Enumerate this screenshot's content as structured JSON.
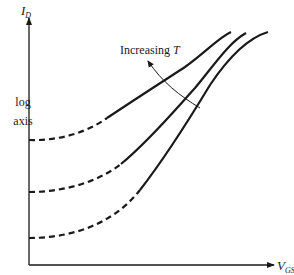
{
  "diagram": {
    "y_axis": {
      "symbol": "I",
      "subscript": "D",
      "note_line1": "log",
      "note_line2": "axis"
    },
    "x_axis": {
      "symbol": "V",
      "subscript": "GS"
    },
    "annotation": {
      "text": "Increasing ",
      "variable": "T"
    },
    "stroke_color": "#1a1a1a",
    "curves": [
      {
        "name": "curve-low-temperature",
        "floor_y": 238
      },
      {
        "name": "curve-mid-temperature",
        "floor_y": 192
      },
      {
        "name": "curve-high-temperature",
        "floor_y": 140
      }
    ]
  }
}
